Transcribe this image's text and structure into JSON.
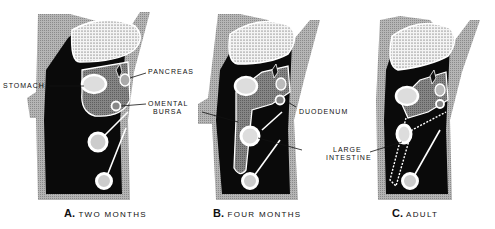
{
  "figure": {
    "panels": [
      {
        "letter": "A.",
        "caption": "TWO MONTHS"
      },
      {
        "letter": "B.",
        "caption": "FOUR MONTHS"
      },
      {
        "letter": "C.",
        "caption": "ADULT"
      }
    ],
    "labels": {
      "stomach": "STOMACH",
      "pancreas": "PANCREAS",
      "omental_1": "OMENTAL",
      "omental_2": "BURSA",
      "duodenum": "DUODENUM",
      "large_1": "LARGE",
      "large_2": "INTESTINE"
    },
    "colors": {
      "cavity": "#0a0a0a",
      "wall": "#a8a8a8",
      "bursa": "#7a7a7a",
      "liver_fill": "#f2f2f2",
      "outline": "#ffffff"
    }
  }
}
